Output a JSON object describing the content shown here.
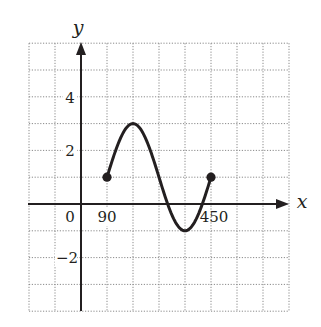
{
  "chart_data": {
    "type": "line",
    "title": "",
    "xlabel": "x",
    "ylabel": "y",
    "function": "y = 1 - 2cos(x)",
    "x_unit": "degrees",
    "xlim": [
      -180,
      720
    ],
    "ylim": [
      -4,
      6
    ],
    "grid": true,
    "grid_x_step": 90,
    "grid_y_step": 1,
    "x_tick_labels": [
      {
        "value": 0,
        "label": "0"
      },
      {
        "value": 90,
        "label": "90"
      },
      {
        "value": 450,
        "label": "450"
      }
    ],
    "y_tick_labels": [
      {
        "value": 4,
        "label": "4"
      },
      {
        "value": 2,
        "label": "2"
      },
      {
        "value": -2,
        "label": "−2"
      }
    ],
    "series": [
      {
        "name": "curve",
        "domain": [
          90,
          450
        ],
        "x": [
          90,
          180,
          270,
          360,
          450
        ],
        "y": [
          1,
          3,
          1,
          -1,
          1
        ],
        "endpoints": "closed"
      }
    ],
    "key_points": [
      {
        "x": 90,
        "y": 1,
        "marker": "filled-dot"
      },
      {
        "x": 180,
        "y": 3,
        "kind": "maximum"
      },
      {
        "x": 270,
        "y": 1
      },
      {
        "x": 360,
        "y": -1,
        "kind": "minimum"
      },
      {
        "x": 450,
        "y": 1,
        "marker": "filled-dot"
      }
    ],
    "legend": null
  },
  "labels": {
    "x_axis": "x",
    "y_axis": "y",
    "origin": "0",
    "x90": "90",
    "x450": "450",
    "y4": "4",
    "y2": "2",
    "yneg2": "−2"
  },
  "colors": {
    "ink": "#231f20",
    "grid": "#8a8a8a",
    "background": "#ffffff"
  }
}
